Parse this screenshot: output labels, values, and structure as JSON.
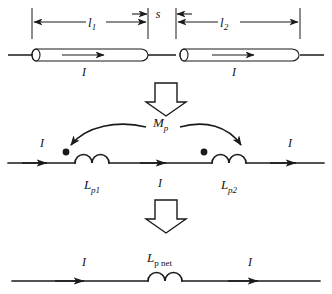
{
  "figure": {
    "width": 332,
    "height": 294,
    "stroke_color": "#1a1a1a",
    "background": "#ffffff"
  },
  "panel_top": {
    "name": "physical-geometry",
    "dimension_l1": {
      "base": "l",
      "sub": "1"
    },
    "dimension_s": {
      "base": "s",
      "sub": ""
    },
    "dimension_l2": {
      "base": "l",
      "sub": "2"
    },
    "rod_left_current": {
      "base": "I",
      "sub": ""
    },
    "rod_right_current": {
      "base": "I",
      "sub": ""
    }
  },
  "transition_1": {
    "name": "down-block-arrow-top",
    "glyph": "block-arrow-down"
  },
  "panel_middle": {
    "name": "coupled-partial-inductance-circuit",
    "mutual_label": {
      "base": "M",
      "sub": "p"
    },
    "inductor_left_label": {
      "base": "L",
      "sub": "p1"
    },
    "inductor_right_label": {
      "base": "L",
      "sub": "p2"
    },
    "current_in": {
      "base": "I",
      "sub": ""
    },
    "current_mid": {
      "base": "I",
      "sub": ""
    },
    "current_out": {
      "base": "I",
      "sub": ""
    }
  },
  "transition_2": {
    "name": "down-block-arrow-bottom",
    "glyph": "block-arrow-down"
  },
  "panel_bottom": {
    "name": "net-partial-inductance-circuit",
    "inductor_label": {
      "base": "L",
      "sub": "p net"
    },
    "current_in": {
      "base": "I",
      "sub": ""
    },
    "current_out": {
      "base": "I",
      "sub": ""
    }
  }
}
